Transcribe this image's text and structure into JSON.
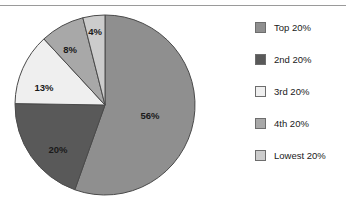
{
  "chart_data": {
    "type": "pie",
    "title": "",
    "categories": [
      "Top 20%",
      "2nd 20%",
      "3rd 20%",
      "4th 20%",
      "Lowest 20%"
    ],
    "values": [
      56,
      20,
      13,
      8,
      4
    ],
    "value_labels": [
      "56%",
      "20%",
      "13%",
      "8%",
      "4%"
    ],
    "unit": "percent",
    "colors": [
      "#8f8f8f",
      "#595959",
      "#efefef",
      "#a8a8a8",
      "#cccccc"
    ],
    "start_angle_deg": 0,
    "direction": "clockwise",
    "legend_position": "right",
    "grid": false,
    "labels_inside_slices": true,
    "xlabel": "",
    "ylabel": ""
  },
  "pie": {
    "center_x": 105,
    "center_y": 97,
    "radius": 90,
    "stroke_color": "#4a4a4a",
    "slices": [
      {
        "name": "Top 20%",
        "value": 56,
        "label": "56%",
        "color": "#8f8f8f",
        "label_x": 150,
        "label_y": 108
      },
      {
        "name": "2nd 20%",
        "value": 20,
        "label": "20%",
        "color": "#595959",
        "label_x": 58,
        "label_y": 142
      },
      {
        "name": "3rd 20%",
        "value": 13,
        "label": "13%",
        "color": "#efefef",
        "label_x": 44,
        "label_y": 80
      },
      {
        "name": "4th 20%",
        "value": 8,
        "label": "8%",
        "color": "#a8a8a8",
        "label_x": 70,
        "label_y": 42
      },
      {
        "name": "Lowest 20%",
        "value": 4,
        "label": "4%",
        "color": "#cccccc",
        "label_x": 95,
        "label_y": 24
      }
    ]
  },
  "legend": {
    "items": [
      {
        "label": "Top 20%",
        "color": "#8f8f8f"
      },
      {
        "label": "2nd 20%",
        "color": "#595959"
      },
      {
        "label": "3rd 20%",
        "color": "#efefef"
      },
      {
        "label": "4th 20%",
        "color": "#a8a8a8"
      },
      {
        "label": "Lowest 20%",
        "color": "#cccccc"
      }
    ]
  },
  "colors": {
    "background": "#ffffff",
    "rule": "#9a9a9a",
    "text": "#1a1a1a",
    "slice_border": "#4a4a4a",
    "swatch_border": "#6d6d6d"
  }
}
